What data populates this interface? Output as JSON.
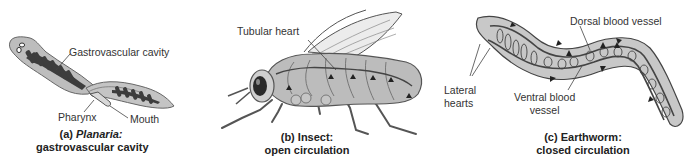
{
  "figure": {
    "panels": [
      {
        "id": "a",
        "organism": "Planaria",
        "caption_letter": "(a)",
        "caption_name": "Planaria:",
        "caption_subtitle": "gastrovascular cavity",
        "labels": {
          "gastrovascular_cavity": "Gastrovascular cavity",
          "pharynx": "Pharynx",
          "mouth": "Mouth"
        }
      },
      {
        "id": "b",
        "organism": "Insect",
        "caption_title": "(b) Insect:",
        "caption_subtitle": "open circulation",
        "labels": {
          "tubular_heart": "Tubular heart"
        }
      },
      {
        "id": "c",
        "organism": "Earthworm",
        "caption_title": "(c) Earthworm:",
        "caption_subtitle": "closed circulation",
        "labels": {
          "dorsal_blood_vessel": "Dorsal blood vessel",
          "lateral_hearts_line1": "Lateral",
          "lateral_hearts_line2": "hearts",
          "ventral_blood_vessel_line1": "Ventral blood",
          "ventral_blood_vessel_line2": "vessel"
        }
      }
    ],
    "colors": {
      "body_fill": "#b9b9b9",
      "body_light": "#d6d6d6",
      "outline": "#555555",
      "cavity_dark": "#3a3a3a",
      "background": "#ffffff"
    }
  }
}
